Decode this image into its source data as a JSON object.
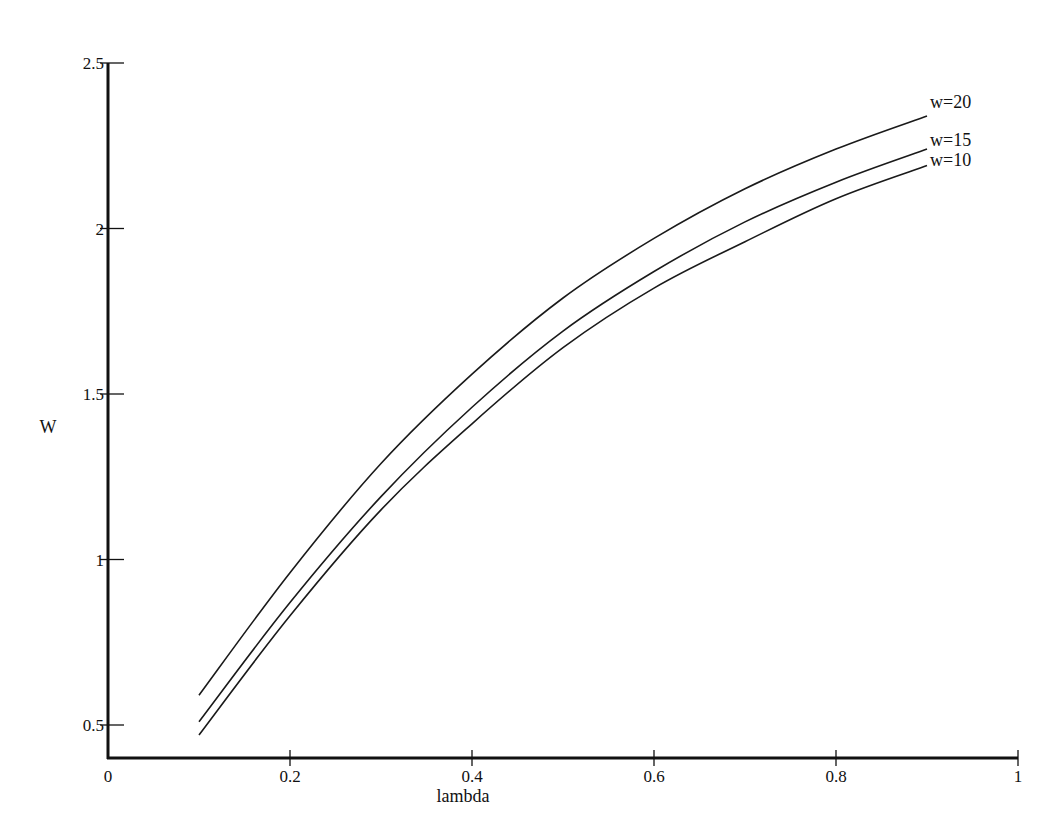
{
  "chart_data": {
    "type": "line",
    "title": "",
    "xlabel": "lambda",
    "ylabel": "W",
    "xlim": [
      0,
      1
    ],
    "ylim": [
      0.4,
      2.5
    ],
    "grid": false,
    "legend_position": "inline labels at right end of curves",
    "x_ticks": [
      0,
      0.2,
      0.4,
      0.6,
      0.8,
      1
    ],
    "x_tick_labels": [
      "0",
      "0.2",
      "0.4",
      "0.6",
      "0.8",
      "1"
    ],
    "y_ticks": [
      0.5,
      1,
      1.5,
      2,
      2.5
    ],
    "y_tick_labels": [
      "0.5",
      "1",
      "1.5",
      "2",
      "2.5"
    ],
    "x": [
      0.1,
      0.2,
      0.3,
      0.4,
      0.5,
      0.6,
      0.7,
      0.8,
      0.9
    ],
    "series": [
      {
        "name": "w=20",
        "values": [
          0.59,
          0.96,
          1.29,
          1.56,
          1.79,
          1.97,
          2.12,
          2.24,
          2.34
        ]
      },
      {
        "name": "w=15",
        "values": [
          0.51,
          0.87,
          1.19,
          1.46,
          1.69,
          1.87,
          2.02,
          2.14,
          2.24
        ]
      },
      {
        "name": "w=10",
        "values": [
          0.47,
          0.83,
          1.15,
          1.41,
          1.64,
          1.82,
          1.96,
          2.09,
          2.19
        ]
      }
    ]
  },
  "colors": {
    "line": "#1a1a1a",
    "axis": "#111111",
    "background": "#ffffff"
  }
}
